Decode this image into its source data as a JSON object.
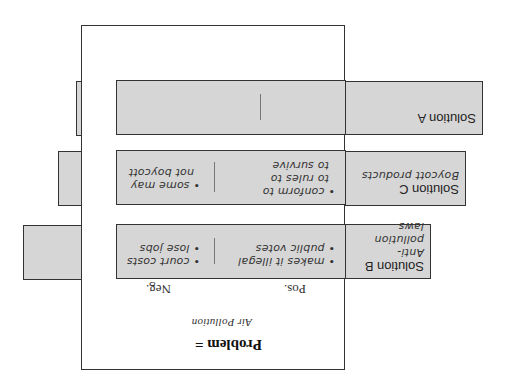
{
  "problem": {
    "heading": "Problem =",
    "topic": "Air Pollution",
    "pos_label": "Pos.",
    "neg_label": "Neg."
  },
  "solutions": [
    {
      "id": "B",
      "title": "Solution B",
      "description": "Anti-pollution laws",
      "desc_lines": [
        "Anti-pollution",
        "laws"
      ],
      "pos": [
        "• makes it illegal",
        "• public votes"
      ],
      "neg": [
        "• court costs",
        "• lose jobs"
      ]
    },
    {
      "id": "C",
      "title": "Solution C",
      "description": "Boycott products",
      "desc_lines": [
        "Boycott products"
      ],
      "pos": [
        "• conform to",
        "to rules to",
        "to survive"
      ],
      "neg": [
        "• some may",
        "not boycott"
      ]
    },
    {
      "id": "A",
      "title": "Solution A",
      "description": "",
      "desc_lines": [],
      "pos": [],
      "neg": []
    }
  ],
  "colors": {
    "box_fill": "#d6d6d6",
    "border": "#333333",
    "panel": "#ffffff"
  }
}
